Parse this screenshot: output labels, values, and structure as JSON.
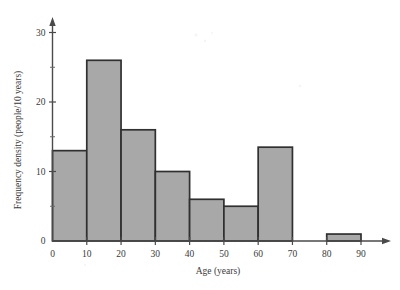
{
  "chart_data": {
    "type": "bar",
    "title": "",
    "subtitle": "",
    "xlabel": "Age (years)",
    "ylabel": "Frequency density (people/10 years)",
    "xlim": [
      0,
      95
    ],
    "ylim": [
      0,
      32
    ],
    "grid": false,
    "legend": null,
    "bin_width": 10,
    "categories": [
      "0-10",
      "10-20",
      "20-30",
      "30-40",
      "40-50",
      "50-60",
      "60-70",
      "70-80",
      "80-90"
    ],
    "bin_edges": [
      0,
      10,
      20,
      30,
      40,
      50,
      60,
      70,
      80,
      90
    ],
    "values": [
      13,
      26,
      16,
      10,
      6,
      5,
      13.5,
      0,
      1
    ],
    "xticks": [
      0,
      10,
      20,
      30,
      40,
      50,
      60,
      70,
      80,
      90
    ],
    "xtick_labels": [
      "0",
      "10",
      "20",
      "30",
      "40",
      "50",
      "60",
      "70",
      "80",
      "90"
    ],
    "yticks": [
      0,
      10,
      20,
      30
    ],
    "ytick_labels": [
      "0",
      "10",
      "20",
      "30"
    ],
    "yticks_minor": [
      5,
      15,
      25
    ],
    "bar_fill_color": "#a8a8a8",
    "bar_edge_color": "#303030",
    "axis_color": "#4a4a4a"
  }
}
